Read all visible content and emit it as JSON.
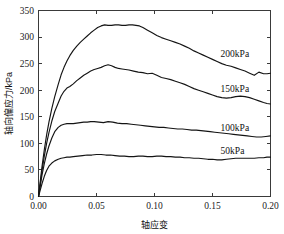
{
  "chart_data": {
    "type": "line",
    "title": "",
    "xlabel": "轴应变",
    "ylabel": "轴向偏应力/kPa",
    "xlim": [
      0.0,
      0.2
    ],
    "ylim": [
      0,
      350
    ],
    "xticks": [
      "0.00",
      "0.05",
      "0.10",
      "0.15",
      "0.20"
    ],
    "xtick_values": [
      0.0,
      0.05,
      0.1,
      0.15,
      0.2
    ],
    "yticks": [
      "0",
      "50",
      "100",
      "150",
      "200",
      "250",
      "300",
      "350"
    ],
    "ytick_values": [
      0,
      50,
      100,
      150,
      200,
      250,
      300,
      350
    ],
    "grid": false,
    "legend_position": "inline-right",
    "line_color": "#141414",
    "series": [
      {
        "name": "200kPa",
        "label": "200kPa",
        "label_x": 0.157,
        "label_y": 262,
        "x": [
          0.0,
          0.0015,
          0.003,
          0.005,
          0.007,
          0.009,
          0.0115,
          0.014,
          0.017,
          0.0195,
          0.022,
          0.0245,
          0.027,
          0.03,
          0.033,
          0.036,
          0.039,
          0.042,
          0.045,
          0.048,
          0.051,
          0.054,
          0.057,
          0.06,
          0.063,
          0.066,
          0.069,
          0.072,
          0.075,
          0.078,
          0.081,
          0.084,
          0.087,
          0.09,
          0.094,
          0.098,
          0.102,
          0.106,
          0.11,
          0.114,
          0.118,
          0.122,
          0.126,
          0.13,
          0.134,
          0.138,
          0.142,
          0.146,
          0.15,
          0.154,
          0.158,
          0.162,
          0.166,
          0.17,
          0.174,
          0.178,
          0.182,
          0.186,
          0.19,
          0.194,
          0.197,
          0.2
        ],
        "y": [
          0,
          28,
          56,
          88,
          116,
          140,
          166,
          188,
          211,
          229,
          243,
          255,
          265,
          275,
          283,
          290,
          296,
          302,
          308,
          313,
          318,
          321,
          323,
          322,
          322,
          323,
          323,
          322,
          322,
          323,
          323,
          322,
          321,
          318,
          313,
          308,
          303,
          299,
          296,
          293,
          290,
          287,
          283,
          279,
          274,
          270,
          266,
          262,
          258,
          254,
          250,
          247,
          245,
          242,
          239,
          236,
          232,
          228,
          234,
          231,
          231,
          232
        ]
      },
      {
        "name": "150kPa",
        "label": "150kPa",
        "label_x": 0.157,
        "label_y": 197,
        "x": [
          0.0,
          0.0015,
          0.003,
          0.005,
          0.007,
          0.009,
          0.0115,
          0.014,
          0.017,
          0.0195,
          0.022,
          0.0245,
          0.027,
          0.03,
          0.033,
          0.036,
          0.039,
          0.042,
          0.045,
          0.048,
          0.051,
          0.054,
          0.057,
          0.06,
          0.063,
          0.066,
          0.069,
          0.072,
          0.075,
          0.078,
          0.082,
          0.086,
          0.09,
          0.094,
          0.098,
          0.102,
          0.106,
          0.11,
          0.114,
          0.118,
          0.122,
          0.126,
          0.13,
          0.134,
          0.138,
          0.142,
          0.146,
          0.15,
          0.154,
          0.158,
          0.162,
          0.166,
          0.17,
          0.174,
          0.178,
          0.182,
          0.186,
          0.19,
          0.194,
          0.197,
          0.2
        ],
        "y": [
          0,
          24,
          48,
          76,
          100,
          120,
          142,
          160,
          176,
          189,
          198,
          204,
          207,
          212,
          218,
          223,
          228,
          232,
          236,
          239,
          241,
          243,
          246,
          248,
          246,
          243,
          241,
          240,
          239,
          238,
          236,
          234,
          233,
          231,
          232,
          228,
          224,
          222,
          220,
          217,
          214,
          211,
          207,
          203,
          200,
          197,
          194,
          191,
          188,
          186,
          185,
          186,
          188,
          189,
          188,
          186,
          183,
          180,
          177,
          175,
          174
        ]
      },
      {
        "name": "100kPa",
        "label": "100kPa",
        "label_x": 0.157,
        "label_y": 123,
        "x": [
          0.0,
          0.0015,
          0.003,
          0.005,
          0.007,
          0.009,
          0.0115,
          0.014,
          0.017,
          0.0195,
          0.022,
          0.0245,
          0.027,
          0.03,
          0.033,
          0.036,
          0.039,
          0.042,
          0.045,
          0.048,
          0.052,
          0.056,
          0.06,
          0.064,
          0.068,
          0.072,
          0.076,
          0.08,
          0.084,
          0.088,
          0.092,
          0.096,
          0.1,
          0.104,
          0.108,
          0.112,
          0.116,
          0.12,
          0.124,
          0.128,
          0.132,
          0.136,
          0.14,
          0.144,
          0.148,
          0.152,
          0.156,
          0.16,
          0.164,
          0.168,
          0.172,
          0.176,
          0.18,
          0.184,
          0.188,
          0.192,
          0.196,
          0.2
        ],
        "y": [
          0,
          20,
          40,
          62,
          80,
          95,
          110,
          122,
          130,
          134,
          136,
          137,
          137,
          137,
          138,
          139,
          140,
          140,
          141,
          141,
          140,
          139,
          141,
          140,
          138,
          137,
          137,
          136,
          135,
          134,
          133,
          132,
          131,
          130,
          130,
          129,
          128,
          127,
          127,
          126,
          125,
          125,
          124,
          123,
          122,
          121,
          120,
          119,
          118,
          117,
          116,
          115,
          114,
          113,
          112,
          112,
          113,
          114
        ]
      },
      {
        "name": "50kPa",
        "label": "50kPa",
        "label_x": 0.157,
        "label_y": 80,
        "x": [
          0.0,
          0.0015,
          0.003,
          0.005,
          0.007,
          0.009,
          0.0115,
          0.014,
          0.017,
          0.0195,
          0.022,
          0.0245,
          0.027,
          0.03,
          0.034,
          0.038,
          0.042,
          0.046,
          0.05,
          0.054,
          0.058,
          0.062,
          0.066,
          0.07,
          0.074,
          0.078,
          0.082,
          0.086,
          0.09,
          0.094,
          0.098,
          0.102,
          0.106,
          0.11,
          0.114,
          0.118,
          0.122,
          0.126,
          0.13,
          0.134,
          0.138,
          0.142,
          0.146,
          0.15,
          0.154,
          0.158,
          0.162,
          0.166,
          0.17,
          0.174,
          0.178,
          0.182,
          0.186,
          0.19,
          0.194,
          0.197,
          0.2
        ],
        "y": [
          0,
          12,
          24,
          38,
          49,
          57,
          63,
          67,
          70,
          72,
          73,
          74,
          74,
          75,
          76,
          77,
          78,
          78,
          79,
          79,
          78,
          78,
          77,
          76,
          76,
          75,
          75,
          76,
          76,
          75,
          75,
          76,
          76,
          75,
          75,
          74,
          74,
          73,
          73,
          72,
          72,
          71,
          70,
          70,
          69,
          69,
          70,
          71,
          72,
          72,
          72,
          72,
          72,
          73,
          73,
          74,
          74
        ]
      }
    ]
  }
}
